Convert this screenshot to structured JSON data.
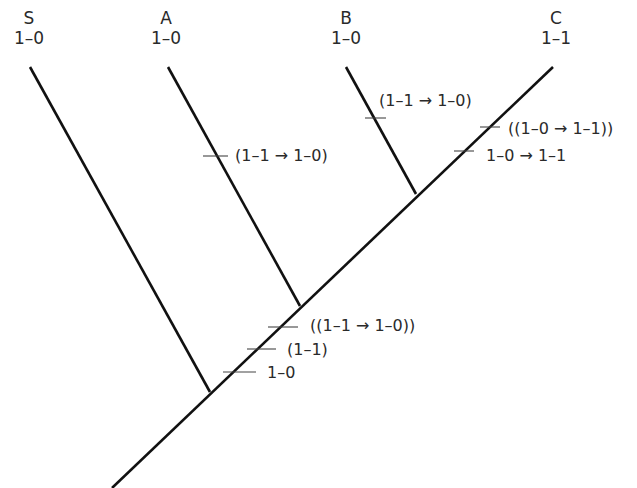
{
  "diagram": {
    "type": "phylogenetic-tree",
    "taxa": [
      {
        "name": "S",
        "state": "1–0"
      },
      {
        "name": "A",
        "state": "1–0"
      },
      {
        "name": "B",
        "state": "1–0"
      },
      {
        "name": "C",
        "state": "1–1"
      }
    ],
    "events": {
      "branch_A": "(1–1 → 1–0)",
      "branch_B": "(1–1 → 1–0)",
      "branch_C_upper": "((1–0 → 1–1))",
      "branch_C_lower": "1–0 → 1–1",
      "stem_upper": "((1–1 → 1–0))",
      "stem_middle": "(1–1)",
      "stem_lower": "1–0"
    },
    "colors": {
      "line": "#111111",
      "text": "#2a2a2a",
      "background": "#ffffff"
    }
  }
}
